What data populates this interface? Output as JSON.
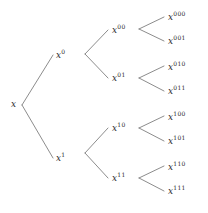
{
  "figure": {
    "name": "binary-expansion-tree",
    "width": 208,
    "height": 213,
    "background_color": "#ffffff",
    "edge_color": "#5a5a5a",
    "text_color": "#2b2b2b"
  },
  "nodes": [
    {
      "id": "root",
      "base": "x",
      "sup": "",
      "x": 11,
      "y": 100,
      "level": 0
    },
    {
      "id": "n0",
      "base": "x",
      "sup": "0",
      "x": 56,
      "y": 49,
      "level": 1
    },
    {
      "id": "n1",
      "base": "x",
      "sup": "1",
      "x": 56,
      "y": 152,
      "level": 1
    },
    {
      "id": "n00",
      "base": "x",
      "sup": "00",
      "x": 112,
      "y": 24,
      "level": 2
    },
    {
      "id": "n01",
      "base": "x",
      "sup": "01",
      "x": 112,
      "y": 72,
      "level": 2
    },
    {
      "id": "n10",
      "base": "x",
      "sup": "10",
      "x": 112,
      "y": 122,
      "level": 2
    },
    {
      "id": "n11",
      "base": "x",
      "sup": "11",
      "x": 112,
      "y": 172,
      "level": 2
    },
    {
      "id": "n000",
      "base": "x",
      "sup": "000",
      "x": 168,
      "y": 11,
      "level": 3
    },
    {
      "id": "n001",
      "base": "x",
      "sup": "001",
      "x": 168,
      "y": 35,
      "level": 3
    },
    {
      "id": "n010",
      "base": "x",
      "sup": "010",
      "x": 168,
      "y": 61,
      "level": 3
    },
    {
      "id": "n011",
      "base": "x",
      "sup": "011",
      "x": 168,
      "y": 85,
      "level": 3
    },
    {
      "id": "n100",
      "base": "x",
      "sup": "100",
      "x": 168,
      "y": 111,
      "level": 3
    },
    {
      "id": "n101",
      "base": "x",
      "sup": "101",
      "x": 168,
      "y": 135,
      "level": 3
    },
    {
      "id": "n110",
      "base": "x",
      "sup": "110",
      "x": 168,
      "y": 161,
      "level": 3
    },
    {
      "id": "n111",
      "base": "x",
      "sup": "111",
      "x": 168,
      "y": 185,
      "level": 3
    }
  ],
  "edges": [
    {
      "id": "e-root-0",
      "from": "root",
      "to": "n0",
      "x1": 22,
      "y1": 105,
      "x2": 53,
      "y2": 55
    },
    {
      "id": "e-root-1",
      "from": "root",
      "to": "n1",
      "x1": 22,
      "y1": 105,
      "x2": 53,
      "y2": 158
    },
    {
      "id": "e-0-00",
      "from": "n0",
      "to": "n00",
      "x1": 85,
      "y1": 54,
      "x2": 108,
      "y2": 30
    },
    {
      "id": "e-0-01",
      "from": "n0",
      "to": "n01",
      "x1": 85,
      "y1": 54,
      "x2": 108,
      "y2": 78
    },
    {
      "id": "e-1-10",
      "from": "n1",
      "to": "n10",
      "x1": 85,
      "y1": 153,
      "x2": 108,
      "y2": 128
    },
    {
      "id": "e-1-11",
      "from": "n1",
      "to": "n11",
      "x1": 85,
      "y1": 153,
      "x2": 108,
      "y2": 178
    },
    {
      "id": "e-00-000",
      "from": "n00",
      "to": "n000",
      "x1": 139,
      "y1": 29,
      "x2": 164,
      "y2": 17
    },
    {
      "id": "e-00-001",
      "from": "n00",
      "to": "n001",
      "x1": 139,
      "y1": 29,
      "x2": 164,
      "y2": 41
    },
    {
      "id": "e-01-010",
      "from": "n01",
      "to": "n010",
      "x1": 139,
      "y1": 78,
      "x2": 164,
      "y2": 66
    },
    {
      "id": "e-01-011",
      "from": "n01",
      "to": "n011",
      "x1": 139,
      "y1": 78,
      "x2": 164,
      "y2": 91
    },
    {
      "id": "e-10-100",
      "from": "n10",
      "to": "n100",
      "x1": 139,
      "y1": 128,
      "x2": 164,
      "y2": 116
    },
    {
      "id": "e-10-101",
      "from": "n10",
      "to": "n101",
      "x1": 139,
      "y1": 128,
      "x2": 164,
      "y2": 141
    },
    {
      "id": "e-11-110",
      "from": "n11",
      "to": "n110",
      "x1": 139,
      "y1": 178,
      "x2": 164,
      "y2": 166
    },
    {
      "id": "e-11-111",
      "from": "n11",
      "to": "n111",
      "x1": 139,
      "y1": 178,
      "x2": 164,
      "y2": 191
    }
  ]
}
